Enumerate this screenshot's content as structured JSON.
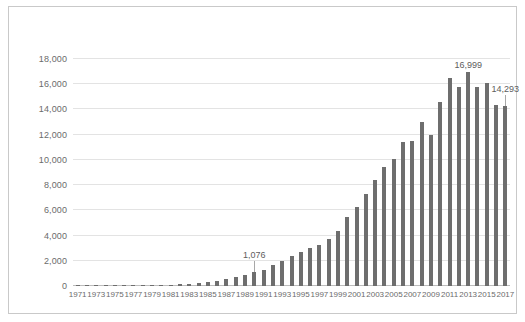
{
  "chart": {
    "type": "bar",
    "title": "",
    "background_color": "#ffffff",
    "bar_color": "#6e6e6e",
    "grid_color": "#e3e3e3",
    "border_color": "#c9c9c9"
  },
  "chart_data": {
    "type": "bar",
    "title": "",
    "subtitle": "",
    "xlabel": "",
    "ylabel": "",
    "ylim": [
      0,
      18000
    ],
    "ytick_labels": [
      "0",
      "2,000",
      "4,000",
      "6,000",
      "8,000",
      "10,000",
      "12,000",
      "14,000",
      "16,000",
      "18,000"
    ],
    "ytick_values": [
      0,
      2000,
      4000,
      6000,
      8000,
      10000,
      12000,
      14000,
      16000,
      18000
    ],
    "grid": true,
    "legend": "none",
    "x": [
      1971,
      1972,
      1973,
      1974,
      1975,
      1976,
      1977,
      1978,
      1979,
      1980,
      1981,
      1982,
      1983,
      1984,
      1985,
      1986,
      1987,
      1988,
      1989,
      1990,
      1991,
      1992,
      1993,
      1994,
      1995,
      1996,
      1997,
      1998,
      1999,
      2000,
      2001,
      2002,
      2003,
      2004,
      2005,
      2006,
      2007,
      2008,
      2009,
      2010,
      2011,
      2012,
      2013,
      2014,
      2015,
      2016,
      2017
    ],
    "xtick_labels": [
      "1971",
      "1973",
      "1975",
      "1977",
      "1979",
      "1981",
      "1983",
      "1985",
      "1987",
      "1989",
      "1991",
      "1993",
      "1995",
      "1997",
      "1999",
      "2001",
      "2003",
      "2005",
      "2007",
      "2009",
      "2011",
      "2013",
      "2015",
      "2017"
    ],
    "values": [
      20,
      25,
      30,
      35,
      40,
      45,
      55,
      65,
      75,
      90,
      110,
      140,
      180,
      240,
      320,
      420,
      540,
      700,
      870,
      1076,
      1300,
      1650,
      2000,
      2350,
      2700,
      3000,
      3250,
      3700,
      4350,
      5500,
      6300,
      7300,
      8400,
      9400,
      10100,
      11400,
      11500,
      13000,
      12000,
      14600,
      16500,
      15800,
      16999,
      15800,
      16100,
      14350,
      14293
    ],
    "annotations": [
      {
        "label": "1,076",
        "x": 1990,
        "value": 1076
      },
      {
        "label": "16,999",
        "x": 2013,
        "value": 16999
      },
      {
        "label": "14,293",
        "x": 2017,
        "value": 14293
      }
    ]
  }
}
